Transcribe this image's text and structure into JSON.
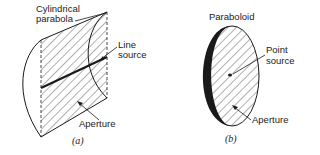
{
  "figure_a": {
    "title_line1": "Cylindrical",
    "title_line2": "parabola",
    "line_source_line1": "Line",
    "line_source_line2": "source",
    "aperture": "Aperture",
    "caption": "(a)"
  },
  "figure_b": {
    "title": "Paraboloid",
    "point_source_line1": "Point",
    "point_source_line2": "source",
    "aperture": "Aperture",
    "caption": "(b)"
  },
  "colors": {
    "ink": "#1a1a1a",
    "background": "#ffffff"
  }
}
